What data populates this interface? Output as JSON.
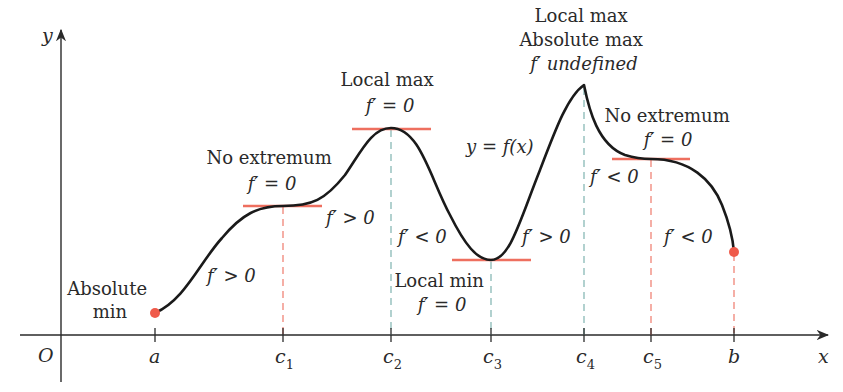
{
  "colors": {
    "curve": "#1a1a1a",
    "axis": "#2a2a2a",
    "tangent": "#ee6f5f",
    "dash_red": "#ef7a6c",
    "dash_teal": "#7fb3b0",
    "endpoint": "#ef5a4a"
  },
  "axes": {
    "x_label": "x",
    "y_label": "y",
    "origin_label": "O"
  },
  "ticks": [
    {
      "id": "a",
      "label": "a",
      "sub": ""
    },
    {
      "id": "c1",
      "label": "c",
      "sub": "1"
    },
    {
      "id": "c2",
      "label": "c",
      "sub": "2"
    },
    {
      "id": "c3",
      "label": "c",
      "sub": "3"
    },
    {
      "id": "c4",
      "label": "c",
      "sub": "4"
    },
    {
      "id": "c5",
      "label": "c",
      "sub": "5"
    },
    {
      "id": "b",
      "label": "b",
      "sub": ""
    }
  ],
  "annotations": {
    "abs_min": {
      "line1": "Absolute",
      "line2": "min"
    },
    "no_ext_1": {
      "line1": "No extremum",
      "line2": "f′ = 0"
    },
    "local_max": {
      "line1": "Local max",
      "line2": "f′ = 0"
    },
    "local_min": {
      "line1": "Local min",
      "line2": "f′ = 0"
    },
    "abs_max": {
      "line1": "Local max",
      "line2": "Absolute max",
      "line3": "f′ undefined"
    },
    "no_ext_2": {
      "line1": "No extremum",
      "line2": "f′ = 0"
    },
    "curve_label": "y = f(x)"
  },
  "derivative_signs": {
    "a_c1": "f′ > 0",
    "c1_c2": "f′ > 0",
    "c2_c3": "f′ < 0",
    "c3_c4": "f′ > 0",
    "c4_c5": "f′ < 0",
    "c5_b": "f′ < 0"
  }
}
